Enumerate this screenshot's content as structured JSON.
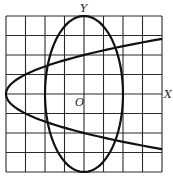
{
  "figure": {
    "grid": {
      "cells_x": 8,
      "cells_y": 8,
      "x_range": [
        -4,
        4
      ],
      "y_range": [
        -4,
        4
      ],
      "unit_px": 19.5,
      "origin_px": [
        84,
        94
      ]
    },
    "labels": {
      "y_axis": "Y",
      "x_axis": "X",
      "origin": "O"
    },
    "curves": [
      {
        "name": "ellipse",
        "equation": "x^2/4 + y^2/16 = 1",
        "center": [
          0,
          0
        ],
        "semi_axis_x": 2,
        "semi_axis_y": 4
      },
      {
        "name": "parabola",
        "equation": "y^2 = x + 4",
        "vertex": [
          -4,
          0
        ],
        "opens": "right"
      }
    ],
    "colors": {
      "background": "#ffffff",
      "grid": "#2a2a2a",
      "curve": "#111111"
    }
  }
}
